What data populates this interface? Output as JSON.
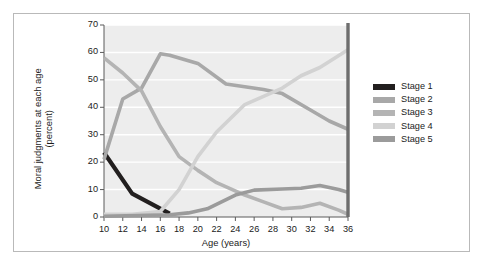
{
  "figure": {
    "background_color": "#ffffff",
    "frame_color": "#b9b9b9",
    "plot_background_color": "#ededed",
    "gridline_color": "#ffffff",
    "axis_color": "#5a5a5a",
    "text_color": "#1b1b1b"
  },
  "chart_data": {
    "type": "line",
    "title": "",
    "xlabel": "Age (years)",
    "ylabel": "Moral judgments at each age (percent)",
    "xlim": [
      10,
      36
    ],
    "ylim": [
      0,
      70
    ],
    "xticks": [
      10,
      12,
      14,
      16,
      18,
      20,
      22,
      24,
      26,
      28,
      30,
      32,
      34,
      36
    ],
    "yticks": [
      0,
      10,
      20,
      30,
      40,
      50,
      60,
      70
    ],
    "xtick_labels": [
      "10",
      "12",
      "14",
      "16",
      "18",
      "20",
      "22",
      "24",
      "26",
      "28",
      "30",
      "32",
      "34",
      "36"
    ],
    "ytick_labels": [
      "0",
      "10",
      "20",
      "30",
      "40",
      "50",
      "60",
      "70"
    ],
    "grid": "horizontal",
    "legend_position": "right",
    "series": [
      {
        "name": "Stage 1",
        "color": "#221f1f",
        "x": [
          10,
          13,
          17
        ],
        "values": [
          23.5,
          8.5,
          1.2
        ]
      },
      {
        "name": "Stage 2",
        "color": "#a8a8a8",
        "x": [
          10,
          12,
          14,
          16,
          17,
          20,
          23,
          25,
          27,
          29,
          32,
          34,
          36
        ],
        "values": [
          21.0,
          43.0,
          47.0,
          59.5,
          59.0,
          56.0,
          48.5,
          47.5,
          46.5,
          45.0,
          39.0,
          35.0,
          32.0
        ]
      },
      {
        "name": "Stage 3",
        "color": "#b4b4b4",
        "x": [
          10,
          12,
          14,
          16,
          18,
          20,
          22,
          25,
          27,
          29,
          31,
          33,
          35,
          36
        ],
        "values": [
          58.0,
          52.5,
          46.0,
          33.0,
          22.0,
          17.0,
          12.5,
          8.0,
          5.5,
          3.0,
          3.5,
          5.0,
          2.5,
          1.0
        ]
      },
      {
        "name": "Stage 4",
        "color": "#d2d2d2",
        "x": [
          10,
          13,
          16,
          18,
          20,
          22,
          25,
          27,
          29,
          31,
          33,
          36
        ],
        "values": [
          1.0,
          1.0,
          2.0,
          10.0,
          22.0,
          31.0,
          41.0,
          44.0,
          47.0,
          51.5,
          54.5,
          61.0
        ]
      },
      {
        "name": "Stage 5",
        "color": "#9b9b9b",
        "x": [
          10,
          17,
          19,
          21,
          24,
          26,
          29,
          31,
          33,
          35,
          36
        ],
        "values": [
          0.3,
          0.8,
          1.5,
          3.0,
          8.0,
          9.8,
          10.2,
          10.5,
          11.5,
          10.0,
          9.0
        ]
      }
    ]
  },
  "legend": {
    "items": [
      {
        "label": "Stage 1",
        "color": "#221f1f"
      },
      {
        "label": "Stage 2",
        "color": "#a8a8a8"
      },
      {
        "label": "Stage 3",
        "color": "#b4b4b4"
      },
      {
        "label": "Stage 4",
        "color": "#d2d2d2"
      },
      {
        "label": "Stage 5",
        "color": "#9b9b9b"
      }
    ]
  }
}
